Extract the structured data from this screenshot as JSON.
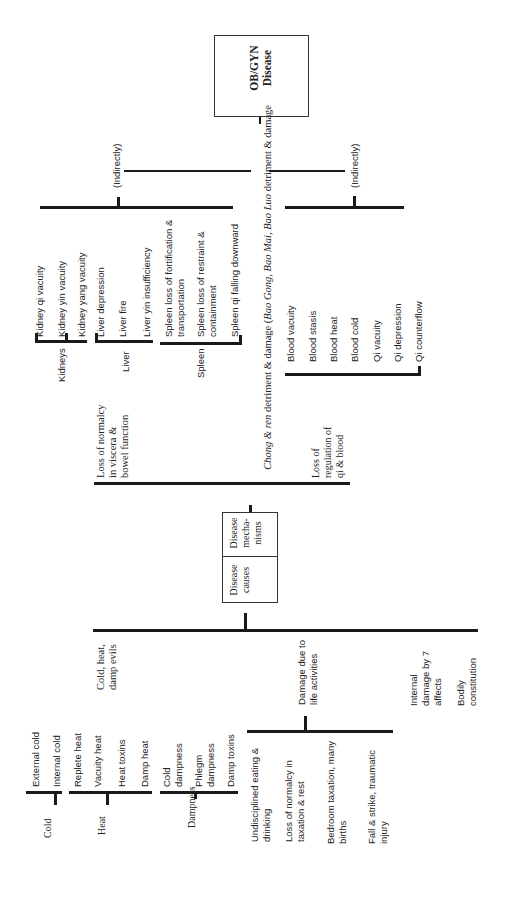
{
  "root": {
    "label": "OB/GYN\nDisease"
  },
  "trunk_label": {
    "prefix": "Chong & ren",
    "text1": " detriment & damage (",
    "italic1": "Bao Gong, Bao Mai, Bao Luo",
    "text2": " detriment & damage"
  },
  "indirect_labels": [
    "(Indirectly)",
    "(Indirectly)"
  ],
  "mechanisms_box": {
    "mechanisms": "Disease\nmecha-\nnisms",
    "causes": "Disease\ncauses"
  },
  "mechanisms": {
    "viscera": {
      "label": "Loss of normalcy\nin viscera &\nbowel function",
      "groups": [
        {
          "label": "Kidneys",
          "items": [
            "Kidney qi vacuity",
            "Kidney yin vacuity",
            "Kidney yang vacuity"
          ]
        },
        {
          "label": "Liver",
          "items": [
            "Liver depression",
            "Liver fire",
            "Liver yin insufficiency"
          ]
        },
        {
          "label": "Spleen",
          "items": [
            "Spleen loss of fortification &\ntransportation",
            "Spleen loss of restraint &\ncontainment",
            "Spleen qi falling downward"
          ]
        }
      ]
    },
    "qi_blood": {
      "label": "Loss of\nregulation of\nqi & blood",
      "items": [
        "Blood vacuity",
        "Blood stasis",
        "Blood heat",
        "Blood cold",
        "Qi vacuity",
        "Qi depression",
        "Qi counterflow"
      ]
    }
  },
  "causes": {
    "evils": {
      "label": "Cold, heat,\ndamp evils",
      "groups": [
        {
          "label": "Cold",
          "items": [
            "External cold",
            "Internal cold"
          ]
        },
        {
          "label": "Heat",
          "items": [
            "Replete heat",
            "Vacuity heat",
            "Heat toxins",
            "Damp heat"
          ]
        },
        {
          "label": "Dampness",
          "items": [
            "Cold\ndampness",
            "Phlegm\ndampness",
            "Damp toxins"
          ]
        }
      ]
    },
    "life": {
      "label": "Damage due to\nlife activities",
      "items": [
        "Undisciplined eating &\ndrinking",
        "Loss of normalcy in\ntaxation & rest",
        "Bedroom taxation, many\nbirths",
        "Fall & strike, traumatic\ninjury"
      ]
    },
    "affects": {
      "label": "Internal\ndamage by 7\naffects"
    },
    "constitution": {
      "label": "Bodily\nconstitution"
    }
  }
}
